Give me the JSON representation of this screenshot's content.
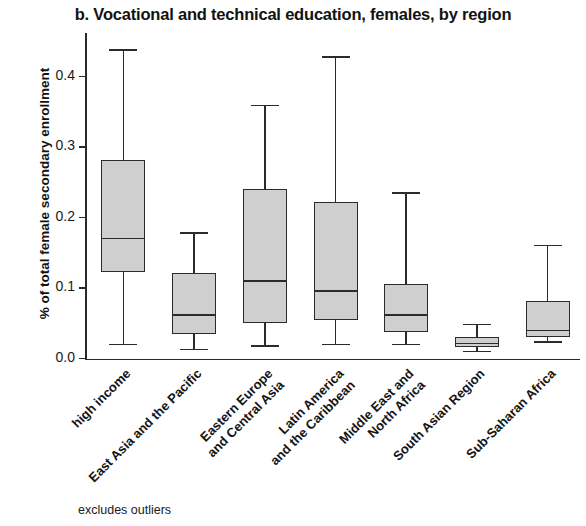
{
  "chart_data": {
    "type": "boxplot",
    "title": "b. Vocational and technical education, females, by region",
    "xlabel": "",
    "ylabel": "% of total female secondary enrollment",
    "footnote": "excludes outliers",
    "ylim": [
      0.0,
      0.46
    ],
    "grid": false,
    "legend": "none",
    "y_ticks": [
      {
        "value": 0.0,
        "label": "0.0"
      },
      {
        "value": 0.1,
        "label": "0.1"
      },
      {
        "value": 0.2,
        "label": "0.2"
      },
      {
        "value": 0.3,
        "label": "0.3"
      },
      {
        "value": 0.4,
        "label": "0.4"
      }
    ],
    "categories": [
      "high income",
      "East Asia and the Pacific",
      "Eastern Europe and Central Asia",
      "Latin America and the Caribbean",
      "Middle East and North Africa",
      "South Asian Region",
      "Sub-Saharan Africa"
    ],
    "boxes": [
      {
        "category": "high income",
        "min": 0.02,
        "q1": 0.123,
        "median": 0.17,
        "q3": 0.282,
        "max": 0.438
      },
      {
        "category": "East Asia and the Pacific",
        "min": 0.013,
        "q1": 0.035,
        "median": 0.062,
        "q3": 0.121,
        "max": 0.178
      },
      {
        "category": "Eastern Europe and Central Asia",
        "min": 0.018,
        "q1": 0.05,
        "median": 0.11,
        "q3": 0.241,
        "max": 0.359
      },
      {
        "category": "Latin America and the Caribbean",
        "min": 0.02,
        "q1": 0.054,
        "median": 0.096,
        "q3": 0.222,
        "max": 0.428
      },
      {
        "category": "Middle East and North Africa",
        "min": 0.02,
        "q1": 0.038,
        "median": 0.062,
        "q3": 0.105,
        "max": 0.235
      },
      {
        "category": "South Asian Region",
        "min": 0.01,
        "q1": 0.017,
        "median": 0.021,
        "q3": 0.031,
        "max": 0.048
      },
      {
        "category": "Sub-Saharan Africa",
        "min": 0.023,
        "q1": 0.031,
        "median": 0.04,
        "q3": 0.082,
        "max": 0.16
      }
    ],
    "x_tick_labels": [
      {
        "lines": [
          "high income"
        ]
      },
      {
        "lines": [
          "East Asia and the Pacific"
        ]
      },
      {
        "lines": [
          "Eastern Europe",
          "and Central Asia"
        ]
      },
      {
        "lines": [
          "Latin America",
          "and the Caribbean"
        ]
      },
      {
        "lines": [
          "Middle East and",
          "North Africa"
        ]
      },
      {
        "lines": [
          "South Asian Region"
        ]
      },
      {
        "lines": [
          "Sub-Saharan Africa"
        ]
      }
    ],
    "colors": {
      "box_fill": "#cfcfcf",
      "line": "#2b2b2b",
      "text": "#151515",
      "background": "#ffffff"
    }
  }
}
